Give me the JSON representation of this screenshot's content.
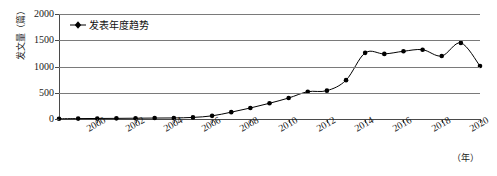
{
  "chart_data": {
    "type": "line",
    "title": "",
    "xlabel": "（年）",
    "ylabel": "发文量（篇）",
    "xlim": [
      1998,
      2020
    ],
    "ylim": [
      0,
      2000
    ],
    "grid": true,
    "legend_position": "top-left",
    "legend": [
      "发表年度趋势"
    ],
    "y_ticks": [
      2000,
      1500,
      1000,
      500,
      0
    ],
    "x_ticks": [
      2000,
      2002,
      2004,
      2006,
      2008,
      2010,
      2012,
      2014,
      2016,
      2018,
      2020
    ],
    "x": [
      1998,
      1999,
      2000,
      2001,
      2002,
      2003,
      2004,
      2005,
      2006,
      2007,
      2008,
      2009,
      2010,
      2011,
      2012,
      2013,
      2014,
      2015,
      2016,
      2017,
      2018,
      2019,
      2020
    ],
    "series": [
      {
        "name": "发表年度趋势",
        "values": [
          5,
          8,
          10,
          12,
          15,
          18,
          20,
          30,
          60,
          130,
          210,
          300,
          400,
          520,
          540,
          740,
          1260,
          1240,
          1290,
          1320,
          1200,
          1450,
          1010
        ],
        "color": "#000000",
        "marker": "diamond"
      }
    ]
  },
  "axis": {
    "y_title": "发文量（篇）",
    "x_unit": "（年）"
  },
  "legend": {
    "label": "发表年度趋势",
    "marker_color": "#000000"
  }
}
